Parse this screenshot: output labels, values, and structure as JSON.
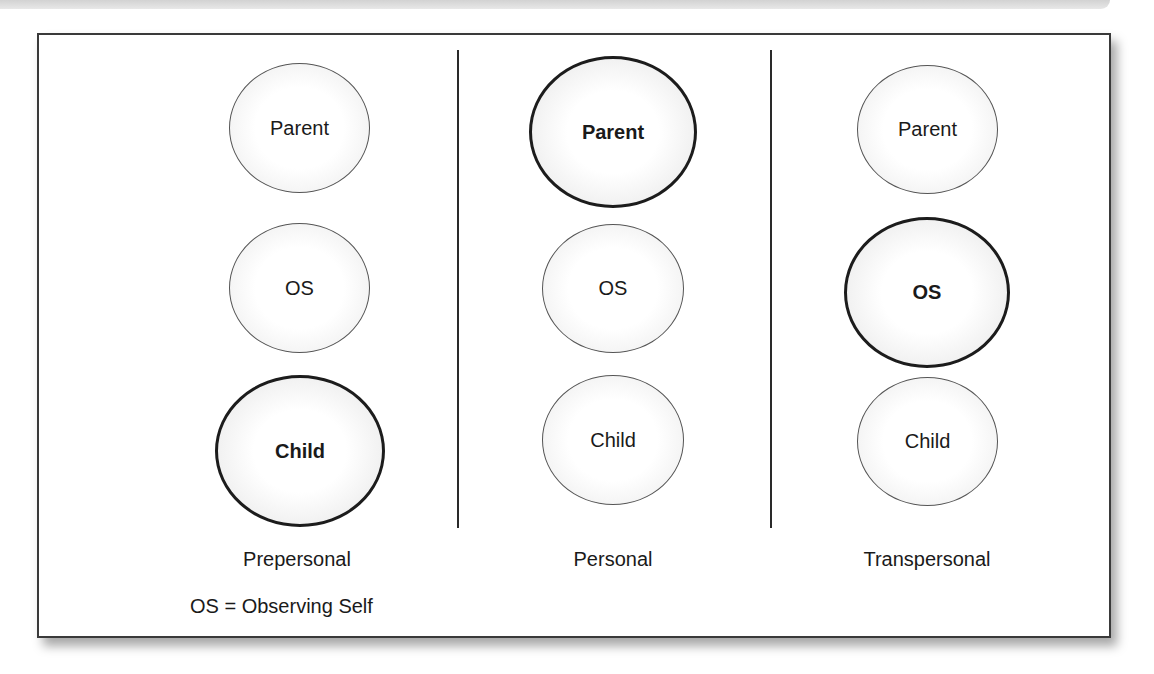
{
  "columns": [
    {
      "label": "Prepersonal",
      "circles": [
        {
          "text": "Parent",
          "emphasized": false
        },
        {
          "text": "OS",
          "emphasized": false
        },
        {
          "text": "Child",
          "emphasized": true
        }
      ]
    },
    {
      "label": "Personal",
      "circles": [
        {
          "text": "Parent",
          "emphasized": true
        },
        {
          "text": "OS",
          "emphasized": false
        },
        {
          "text": "Child",
          "emphasized": false
        }
      ]
    },
    {
      "label": "Transpersonal",
      "circles": [
        {
          "text": "Parent",
          "emphasized": false
        },
        {
          "text": "OS",
          "emphasized": true
        },
        {
          "text": "Child",
          "emphasized": false
        }
      ]
    }
  ],
  "legend": "OS = Observing Self"
}
